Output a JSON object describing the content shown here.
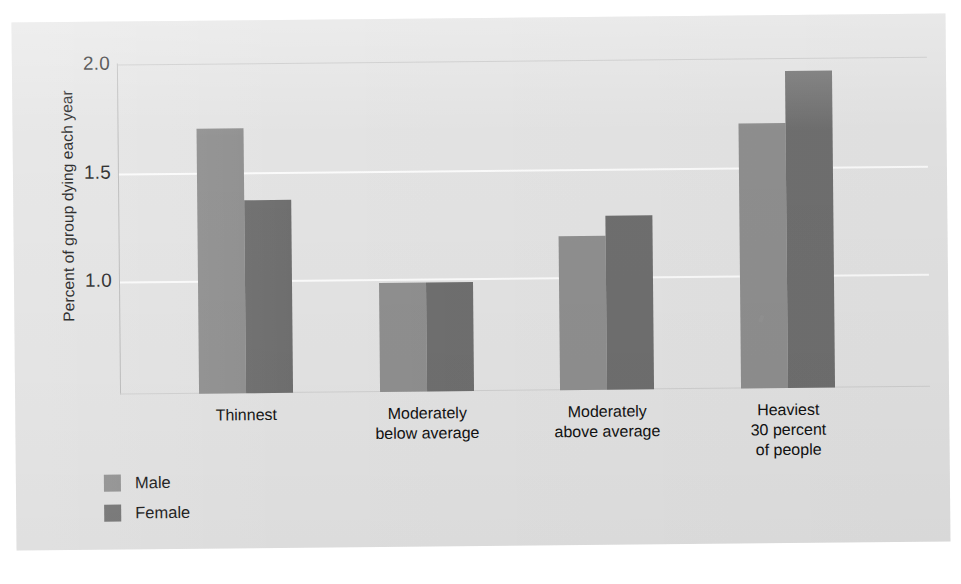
{
  "chart_data": {
    "type": "bar",
    "title": "",
    "subtitle": "",
    "xlabel": "",
    "ylabel": "Percent of group dying each year",
    "categories": [
      "Thinnest",
      "Moderately\nbelow average",
      "Moderately\nabove average",
      "Heaviest\n30 percent\nof people"
    ],
    "series": [
      {
        "name": "Male",
        "color": "#8f8f8f",
        "values": [
          1.7,
          0.98,
          1.19,
          1.7
        ]
      },
      {
        "name": "Female",
        "color": "#6f6f6f",
        "values": [
          1.37,
          0.98,
          1.28,
          1.94
        ]
      }
    ],
    "yticks": [
      "1.0",
      "1.5",
      "2.0"
    ],
    "ytick_values": [
      1.0,
      1.5,
      2.0
    ],
    "ylim": [
      0.48,
      2.06
    ],
    "grid": true,
    "legend_position": "bottom-left",
    "annotations": []
  },
  "legend": {
    "items": [
      {
        "label": "Male",
        "swatch": "male-swatch"
      },
      {
        "label": "Female",
        "swatch": "female-swatch"
      }
    ]
  },
  "colors": {
    "panel_background": "#e3e3e3",
    "page_background": "#ffffff",
    "male_bar": "#8f8f8f",
    "female_bar": "#6f6f6f",
    "gridline": "#fbfbfb",
    "axis": "#b9b9b9",
    "text": "#111111"
  }
}
